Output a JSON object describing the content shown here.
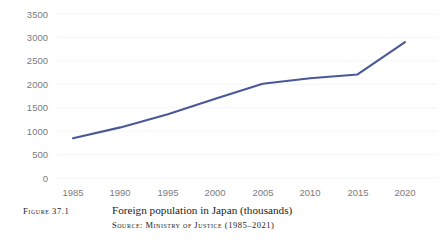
{
  "chart_data": {
    "type": "line",
    "title": "Foreign population in Japan (thousands)",
    "xlabel": "",
    "ylabel": "",
    "x": [
      1985,
      1990,
      1995,
      2000,
      2005,
      2010,
      2015,
      2020
    ],
    "categories": [
      "1985",
      "1990",
      "1995",
      "2000",
      "2005",
      "2010",
      "2015",
      "2020"
    ],
    "series": [
      {
        "name": "Foreign population in Japan (thousands)",
        "values": [
          850,
          1080,
          1360,
          1690,
          2010,
          2130,
          2210,
          2900
        ],
        "color": "#4a5899"
      }
    ],
    "xlim": [
      1985,
      2020
    ],
    "ylim": [
      0,
      3500
    ],
    "ytick_labels": [
      "3500",
      "3000",
      "2500",
      "2000",
      "1500",
      "1000",
      "500",
      "0"
    ],
    "ytick_values": [
      3500,
      3000,
      2500,
      2000,
      1500,
      1000,
      500,
      0
    ],
    "xtick_labels": [
      "1985",
      "1990",
      "1995",
      "2000",
      "2005",
      "2010",
      "2015",
      "2020"
    ],
    "grid": "horizontal",
    "grid_color": "#f2f2f2",
    "legend": "none",
    "annotations": []
  },
  "caption": {
    "figure_number": "Figure 37.1",
    "title": "Foreign population in Japan (thousands)",
    "source": "Source: Ministry of Justice (1985–2021)"
  },
  "colors": {
    "line": "#4a5899",
    "tick_text": "#7b7b7b",
    "caption_text": "#1b1b1b",
    "grid": "#f2f2f2",
    "background": "#ffffff"
  }
}
